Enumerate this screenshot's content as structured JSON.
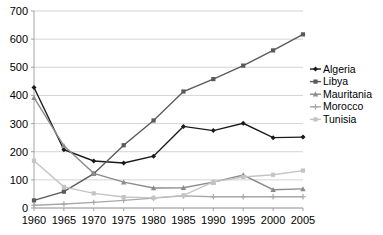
{
  "chart_data": {
    "type": "line",
    "title": "",
    "subtitle": "",
    "xlabel": "",
    "ylabel": "",
    "x": [
      1960,
      1965,
      1970,
      1975,
      1980,
      1985,
      1990,
      1995,
      2000,
      2005
    ],
    "xtick_labels": [
      "1960",
      "1965",
      "1970",
      "1975",
      "1980",
      "1985",
      "1990",
      "1995",
      "2000",
      "2005"
    ],
    "ytick_labels": [
      "0",
      "100",
      "200",
      "300",
      "400",
      "500",
      "600",
      "700"
    ],
    "yticks": [
      0,
      100,
      200,
      300,
      400,
      500,
      600,
      700
    ],
    "ylim": [
      0,
      700
    ],
    "xlim": [
      1960,
      2005
    ],
    "grid": true,
    "legend_position": "right",
    "series": [
      {
        "name": "Algeria",
        "color": "#1a1a1a",
        "marker": "diamond",
        "values": [
          428,
          207,
          167,
          160,
          184,
          290,
          275,
          301,
          250,
          252
        ]
      },
      {
        "name": "Libya",
        "color": "#5a5a5a",
        "marker": "square",
        "values": [
          27,
          58,
          122,
          223,
          311,
          414,
          458,
          506,
          560,
          617
        ]
      },
      {
        "name": "Mauritania",
        "color": "#8c8c8c",
        "marker": "triangle",
        "values": [
          392,
          221,
          123,
          92,
          71,
          72,
          92,
          117,
          65,
          68
        ]
      },
      {
        "name": "Morocco",
        "color": "#a8a8a8",
        "marker": "cross",
        "values": [
          10,
          14,
          20,
          27,
          35,
          43,
          40,
          40,
          40,
          40
        ]
      },
      {
        "name": "Tunisia",
        "color": "#c4c4c4",
        "marker": "square",
        "values": [
          168,
          75,
          52,
          39,
          36,
          45,
          93,
          110,
          118,
          133
        ]
      }
    ]
  },
  "legend": {
    "items": [
      {
        "label": "Algeria"
      },
      {
        "label": "Libya"
      },
      {
        "label": "Mauritania"
      },
      {
        "label": "Morocco"
      },
      {
        "label": "Tunisia"
      }
    ]
  }
}
